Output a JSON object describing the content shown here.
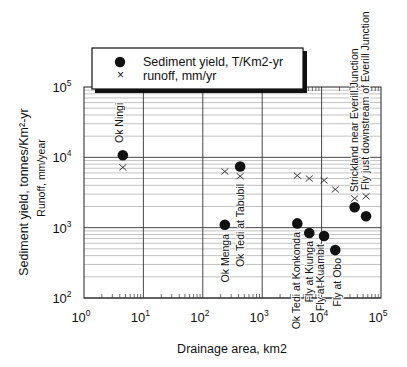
{
  "chart_data": {
    "type": "scatter",
    "title": "",
    "xlabel": "Drainage area, km2",
    "ylabel": "Sediment yield, tonnes/Km²-yr",
    "ylabel2": "Runoff, mm/year",
    "xscale": "log",
    "yscale": "log",
    "xlim": [
      1,
      100000
    ],
    "ylim": [
      100,
      100000
    ],
    "x_ticks": [
      {
        "base": "10",
        "exp": "0"
      },
      {
        "base": "10",
        "exp": "1"
      },
      {
        "base": "10",
        "exp": "2"
      },
      {
        "base": "10",
        "exp": "3"
      },
      {
        "base": "10",
        "exp": "4"
      },
      {
        "base": "10",
        "exp": "5"
      }
    ],
    "y_ticks": [
      {
        "base": "10",
        "exp": "2"
      },
      {
        "base": "10",
        "exp": "3"
      },
      {
        "base": "10",
        "exp": "4"
      },
      {
        "base": "10",
        "exp": "5"
      }
    ],
    "grid": true,
    "legend": {
      "position": "top",
      "entries": [
        {
          "marker": "filled-circle",
          "label": "Sediment yield, T/Km2-yr"
        },
        {
          "marker": "x",
          "label": "runoff, mm/yr"
        }
      ]
    },
    "series": [
      {
        "name": "Sediment yield, T/Km2-yr",
        "marker": "filled-circle",
        "points": [
          {
            "site": "Ok Ningi",
            "x": 4.5,
            "y": 10700
          },
          {
            "site": "Ok Menga",
            "x": 235,
            "y": 1100
          },
          {
            "site": "Ok Tedi at Tabubil",
            "x": 425,
            "y": 7400
          },
          {
            "site": "Ok Tedi at Konkonda",
            "x": 3900,
            "y": 1150
          },
          {
            "site": "Fly at Kiunga",
            "x": 6200,
            "y": 840
          },
          {
            "site": "Fly at Kuambit",
            "x": 11000,
            "y": 760
          },
          {
            "site": "Fly at Obo",
            "x": 17000,
            "y": 480
          },
          {
            "site": "Strickland near Everill Junction",
            "x": 36000,
            "y": 1950
          },
          {
            "site": "Fly just downstream of Everill Junction",
            "x": 56000,
            "y": 1450
          }
        ]
      },
      {
        "name": "runoff, mm/yr",
        "marker": "x",
        "points": [
          {
            "site": "Ok Ningi",
            "x": 4.5,
            "y": 7200
          },
          {
            "site": "Ok Menga",
            "x": 235,
            "y": 6300
          },
          {
            "site": "Ok Tedi at Tabubil",
            "x": 425,
            "y": 5400
          },
          {
            "site": "Ok Tedi at Konkonda",
            "x": 3900,
            "y": 5500
          },
          {
            "site": "Fly at Kiunga",
            "x": 6200,
            "y": 5000
          },
          {
            "site": "Fly at Kuambit",
            "x": 11000,
            "y": 4700
          },
          {
            "site": "Fly at Obo",
            "x": 17000,
            "y": 3500
          },
          {
            "site": "Strickland near Everill Junction",
            "x": 36000,
            "y": 2600
          },
          {
            "site": "Fly just downstream of Everill Junction",
            "x": 56000,
            "y": 2800
          }
        ]
      }
    ],
    "annotations": [
      {
        "text": "Ok Ningi",
        "x": 123,
        "y": 143,
        "anchor": "start"
      },
      {
        "text": "Ok Menga",
        "x": 229,
        "y": 234,
        "anchor": "end"
      },
      {
        "text": "Ok Tedi at Tabubil",
        "x": 244,
        "y": 184,
        "anchor": "end"
      },
      {
        "text": "Ok Tedi at Konkonda",
        "x": 300,
        "y": 232,
        "anchor": "end"
      },
      {
        "text": "Fly at Kiunga",
        "x": 313,
        "y": 241,
        "anchor": "end"
      },
      {
        "text": "Fly at Kuambit",
        "x": 324,
        "y": 244,
        "anchor": "end"
      },
      {
        "text": "Fly at Obo",
        "x": 341,
        "y": 258,
        "anchor": "end"
      },
      {
        "text": "Strickland near Everill Junction",
        "x": 358,
        "y": 192,
        "anchor": "start"
      },
      {
        "text": "Fly just downstream of Everill Junction",
        "x": 369,
        "y": 190,
        "anchor": "start"
      }
    ]
  }
}
